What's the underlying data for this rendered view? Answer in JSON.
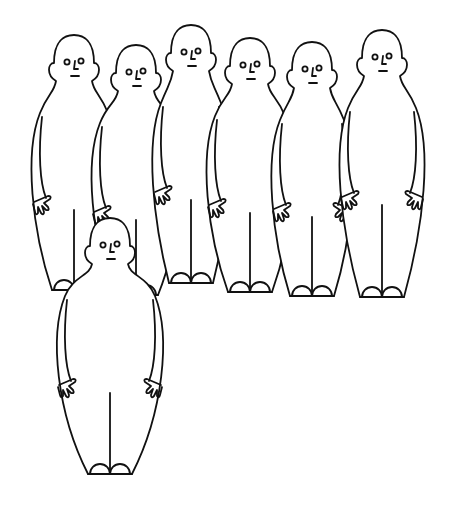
{
  "illustration": {
    "title": "Seven bald cartoon figures standing in a group",
    "background": "#ffffff",
    "stroke_color": "#111111",
    "figures": [
      {
        "id": "back-left",
        "cx": 74,
        "headTop": 35,
        "footY": 290,
        "halfW": 44,
        "scale": 1.0
      },
      {
        "id": "back-second",
        "cx": 136,
        "headTop": 45,
        "footY": 295,
        "halfW": 46,
        "scale": 1.0
      },
      {
        "id": "back-center",
        "cx": 191,
        "headTop": 25,
        "footY": 283,
        "halfW": 40,
        "scale": 0.95
      },
      {
        "id": "middle",
        "cx": 250,
        "headTop": 38,
        "footY": 292,
        "halfW": 45,
        "scale": 1.0
      },
      {
        "id": "middle-right",
        "cx": 312,
        "headTop": 42,
        "footY": 296,
        "halfW": 42,
        "scale": 0.97
      },
      {
        "id": "back-right",
        "cx": 382,
        "headTop": 30,
        "footY": 297,
        "halfW": 44,
        "scale": 1.0
      },
      {
        "id": "front",
        "cx": 110,
        "headTop": 218,
        "footY": 474,
        "halfW": 55,
        "scale": 1.0
      }
    ]
  }
}
